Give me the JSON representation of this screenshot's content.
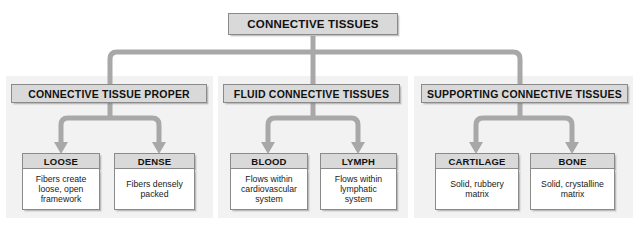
{
  "diagram": {
    "title": "CONNECTIVE TISSUES",
    "colors": {
      "header_fill": "#d9d9d9",
      "body_fill": "#ffffff",
      "panel_fill": "#f2f2f2",
      "connector": "#a8a8a8",
      "border": "#8a8a8a",
      "text": "#111111"
    },
    "root": {
      "label": "CONNECTIVE TISSUES"
    },
    "groups": [
      {
        "id": "connective-tissue-proper",
        "label": "CONNECTIVE TISSUE PROPER",
        "children": [
          {
            "id": "loose",
            "label": "LOOSE",
            "description": "Fibers create\nloose, open\nframework"
          },
          {
            "id": "dense",
            "label": "DENSE",
            "description": "Fibers densely\npacked"
          }
        ]
      },
      {
        "id": "fluid-connective-tissues",
        "label": "FLUID CONNECTIVE TISSUES",
        "children": [
          {
            "id": "blood",
            "label": "BLOOD",
            "description": "Flows within\ncardiovascular\nsystem"
          },
          {
            "id": "lymph",
            "label": "LYMPH",
            "description": "Flows within\nlymphatic\nsystem"
          }
        ]
      },
      {
        "id": "supporting-connective-tissues",
        "label": "SUPPORTING CONNECTIVE TISSUES",
        "children": [
          {
            "id": "cartilage",
            "label": "CARTILAGE",
            "description": "Solid, rubbery\nmatrix"
          },
          {
            "id": "bone",
            "label": "BONE",
            "description": "Solid, crystalline\nmatrix"
          }
        ]
      }
    ]
  }
}
